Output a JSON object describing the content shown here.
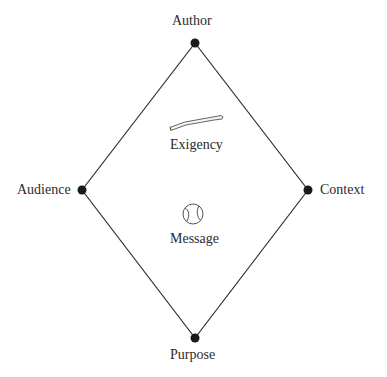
{
  "diagram": {
    "type": "rhetorical-diamond",
    "colors": {
      "line": "#2a2a2a",
      "node": "#1a1a1a",
      "text": "#2b2b2b",
      "icon": "#555555"
    },
    "nodes": [
      {
        "id": "author",
        "label": "Author",
        "x": 195,
        "y": 43
      },
      {
        "id": "context",
        "label": "Context",
        "x": 308,
        "y": 190
      },
      {
        "id": "purpose",
        "label": "Purpose",
        "x": 195,
        "y": 338
      },
      {
        "id": "audience",
        "label": "Audience",
        "x": 82,
        "y": 190
      }
    ],
    "center": [
      {
        "id": "exigency",
        "label": "Exigency",
        "icon": "baseball-bat-icon"
      },
      {
        "id": "message",
        "label": "Message",
        "icon": "baseball-icon"
      }
    ]
  }
}
